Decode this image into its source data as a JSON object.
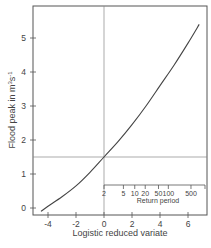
{
  "chart_data": {
    "type": "line",
    "title": "",
    "xlabel": "Logistic reduced variate",
    "ylabel": "Flood peak in m³s⁻¹",
    "xlim": [
      -5.1,
      7.3
    ],
    "ylim": [
      -0.2,
      5.95
    ],
    "x_ticks": [
      -4,
      -2,
      0,
      2,
      4,
      6
    ],
    "y_ticks": [
      0,
      1,
      2,
      3,
      4,
      5
    ],
    "grid": false,
    "legend": null,
    "series": [
      {
        "name": "Flood peak curve",
        "x": [
          -4.5,
          -4.0,
          -3.0,
          -2.0,
          -1.0,
          0.0,
          1.0,
          2.0,
          3.0,
          4.0,
          5.0,
          6.0,
          6.8
        ],
        "y": [
          -0.1,
          0.05,
          0.33,
          0.65,
          1.05,
          1.5,
          1.95,
          2.45,
          3.0,
          3.6,
          4.2,
          4.85,
          5.4
        ]
      }
    ],
    "reference_lines": [
      {
        "orientation": "vertical",
        "x": 0
      },
      {
        "orientation": "horizontal",
        "y": 1.5
      }
    ],
    "secondary_axis": {
      "label": "Return period",
      "position": "inset, y≈1",
      "ticks": [
        2,
        5,
        10,
        20,
        50,
        100,
        500
      ],
      "tick_labels": [
        "2",
        "5",
        "10",
        "20",
        "50",
        "100",
        "500"
      ],
      "mapping": "x = ln(T - 1)"
    }
  },
  "labels": {
    "xlabel": "Logistic reduced variate",
    "ylabel_main": "Flood peak in m",
    "ylabel_sup1": "3",
    "ylabel_mid": "s",
    "ylabel_sup2": "-1",
    "inset_title": "Return period",
    "x_ticks": [
      "-4",
      "-2",
      "0",
      "2",
      "4",
      "6"
    ],
    "y_ticks": [
      "0",
      "1",
      "2",
      "3",
      "4",
      "5"
    ],
    "rp_ticks": [
      "2",
      "5",
      "10",
      "20",
      "50",
      "100",
      "500"
    ]
  }
}
